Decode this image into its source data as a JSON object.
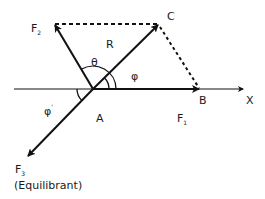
{
  "diagram": {
    "type": "vector-force-diagram",
    "colors": {
      "stroke": "#111111",
      "text": "#1a1a1a",
      "background": "#ffffff"
    },
    "points": {
      "A": {
        "label": "A"
      },
      "B": {
        "label": "B"
      },
      "C": {
        "label": "C"
      }
    },
    "axis": {
      "label": "X"
    },
    "vectors": {
      "F1": {
        "label": "F",
        "subscript": "1",
        "from": "A",
        "to": "B"
      },
      "F2": {
        "label": "F",
        "subscript": "2",
        "from": "A"
      },
      "R": {
        "label": "R",
        "from": "A",
        "to": "C"
      },
      "F3": {
        "label": "F",
        "subscript": "3",
        "from": "A",
        "note": "(Equilibrant)"
      }
    },
    "angles": {
      "theta": {
        "symbol": "θ",
        "between": [
          "F1",
          "F2"
        ]
      },
      "phi": {
        "symbol": "φ",
        "between": [
          "F1",
          "R"
        ]
      },
      "phi_prime": {
        "symbol": "φ",
        "prime": "'",
        "between": [
          "X-axis (negative)",
          "F3"
        ]
      }
    },
    "dashed_lines": [
      {
        "from": "F2 tip",
        "to": "C"
      },
      {
        "from": "C",
        "to": "B"
      }
    ]
  }
}
